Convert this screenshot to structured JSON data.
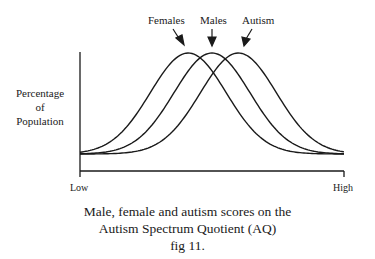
{
  "chart_data": {
    "type": "line",
    "title": "Male, female and autism scores on the Autism Spectrum Quotient (AQ)",
    "figure_label": "fig 11.",
    "xlabel": "",
    "ylabel": "Percentage of Population",
    "x_tick_labels": [
      "Low",
      "High"
    ],
    "grid": false,
    "legend_position": "top annotations with arrows",
    "series": [
      {
        "name": "Females",
        "peak_position": 0.41,
        "relative_peak_height": 1.0
      },
      {
        "name": "Males",
        "peak_position": 0.5,
        "relative_peak_height": 1.0
      },
      {
        "name": "Autism",
        "peak_position": 0.6,
        "relative_peak_height": 1.0
      }
    ]
  },
  "labels": {
    "females": "Females",
    "males": "Males",
    "autism": "Autism",
    "ylabel_line1": "Percentage",
    "ylabel_line2": "of",
    "ylabel_line3": "Population",
    "x_low": "Low",
    "x_high": "High",
    "caption_line1": "Male, female and autism scores on the",
    "caption_line2": "Autism Spectrum Quotient (AQ)",
    "caption_line3": "fig 11."
  }
}
